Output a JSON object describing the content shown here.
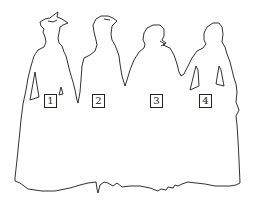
{
  "figure": {
    "line_color": "#1a1a1a",
    "background": "#ffffff",
    "labels": [
      {
        "id": "1",
        "text": "1",
        "x": 44,
        "y": 94
      },
      {
        "id": "2",
        "text": "2",
        "x": 92,
        "y": 94
      },
      {
        "id": "3",
        "text": "3",
        "x": 150,
        "y": 94
      },
      {
        "id": "4",
        "text": "4",
        "x": 199,
        "y": 94
      }
    ]
  }
}
